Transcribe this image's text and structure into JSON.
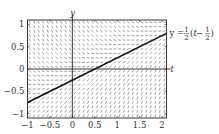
{
  "chart_data": {
    "type": "line",
    "subtype": "slope-field",
    "title": "",
    "xlabel": "t",
    "ylabel": "y",
    "differential_equation": "dy/dt = t - 2y",
    "xlim": [
      -1,
      2.1
    ],
    "ylim": [
      -1.1,
      1.1
    ],
    "xticks": [
      -1,
      -0.5,
      0,
      0.5,
      1,
      1.5,
      2
    ],
    "xtick_labels": [
      "−1",
      "−0.5",
      "0",
      "0.5",
      "1",
      "1.5",
      "2"
    ],
    "yticks": [
      -1,
      -0.5,
      0,
      0.5,
      1
    ],
    "ytick_labels": [
      "−1",
      "−0.5",
      "0",
      "0.5",
      "1"
    ],
    "grid": false,
    "slope_field": {
      "t_step": 0.1,
      "y_step": 0.1
    },
    "series": [
      {
        "name": "y = 1/2 (t − 1/2)",
        "x": [
          -1,
          2.1
        ],
        "y": [
          -0.75,
          0.8
        ]
      }
    ],
    "annotation": {
      "prefix": "y =",
      "frac1_num": "1",
      "frac1_den": "2",
      "open": "(",
      "var": "t",
      "minus": " −",
      "frac2_num": "1",
      "frac2_den": "2",
      "close": ")",
      "position": "right-of-line-end"
    },
    "colors": {
      "line": "#111111",
      "field": "#555555",
      "axes": "#222222"
    }
  }
}
